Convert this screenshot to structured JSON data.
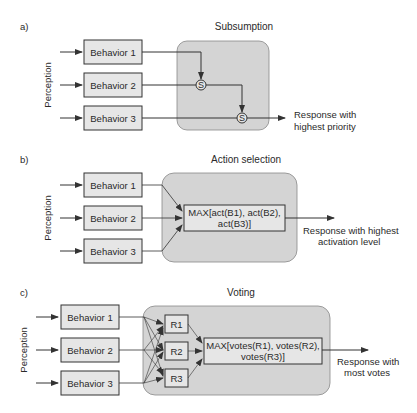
{
  "panels": [
    {
      "letter": "a)",
      "title": "Subsumption",
      "side_label": "Perception",
      "behaviors": [
        "Behavior 1",
        "Behavior 2",
        "Behavior 3"
      ],
      "switch_label": "S",
      "output": [
        "Response with",
        "highest priority"
      ]
    },
    {
      "letter": "b)",
      "title": "Action selection",
      "side_label": "Perception",
      "behaviors": [
        "Behavior 1",
        "Behavior 2",
        "Behavior 3"
      ],
      "selector": [
        "MAX[act(B1), act(B2),",
        "act(B3)]"
      ],
      "output": [
        "Response with highest",
        "activation level"
      ]
    },
    {
      "letter": "c)",
      "title": "Voting",
      "side_label": "Perception",
      "behaviors": [
        "Behavior 1",
        "Behavior 2",
        "Behavior 3"
      ],
      "responses": [
        "R1",
        "R2",
        "R3"
      ],
      "selector": [
        "MAX[votes(R1), votes(R2),",
        "votes(R3)]"
      ],
      "output": [
        "Response with",
        "most votes"
      ]
    }
  ],
  "colors": {
    "box_fill": "#e6e6e6",
    "region_fill": "#d4d4d4",
    "stroke": "#333333"
  }
}
